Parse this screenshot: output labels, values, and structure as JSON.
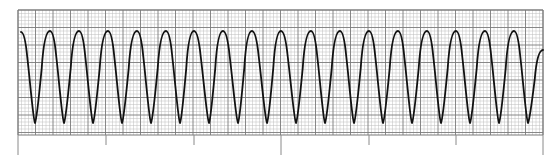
{
  "chart_data": {
    "type": "line",
    "title": "",
    "xlabel": "",
    "ylabel": "",
    "grid": {
      "on": true,
      "left": 18,
      "top": 10,
      "right": 543,
      "bottom": 135,
      "minor_px": 3.5,
      "major_every": 5,
      "minor_color": "#bdbdbd",
      "major_color": "#7a7a7a"
    },
    "ticks_below": [
      {
        "x": 18,
        "len": 22
      },
      {
        "x": 106,
        "len": 10
      },
      {
        "x": 194,
        "len": 10
      },
      {
        "x": 281,
        "len": 22
      },
      {
        "x": 369,
        "len": 10
      },
      {
        "x": 456,
        "len": 10
      },
      {
        "x": 543,
        "len": 22
      }
    ],
    "trace": {
      "color": "#111111",
      "width": 1.8,
      "start": {
        "x": 21,
        "y": 32
      },
      "peaks_x": [
        50,
        79,
        108,
        137,
        166,
        194,
        223,
        252,
        281,
        311,
        340,
        369,
        398,
        427,
        456,
        485,
        514
      ],
      "troughs_x": [
        35,
        64,
        93,
        122,
        151,
        180,
        209,
        238,
        267,
        296,
        325,
        354,
        383,
        412,
        441,
        470,
        499,
        528
      ],
      "peak_y": 31,
      "trough_y": 123,
      "end": {
        "x": 543,
        "y": 50
      }
    },
    "cycle_count": 18,
    "period_px": 29.1
  }
}
